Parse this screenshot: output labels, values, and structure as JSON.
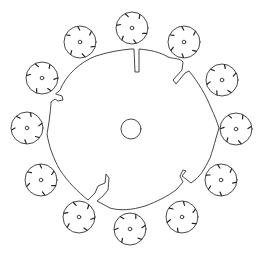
{
  "diagram": {
    "colors": {
      "line": "#333333",
      "background": "#ffffff"
    },
    "center_circle": {
      "cx": 131,
      "cy": 129,
      "r": 10
    },
    "outer_shape": {
      "cx": 131,
      "cy": 129,
      "r": 82,
      "notches": 6
    },
    "satellites": [
      {
        "cx": 132,
        "cy": 28,
        "r": 16
      },
      {
        "cx": 184,
        "cy": 42,
        "r": 16
      },
      {
        "cx": 222,
        "cy": 80,
        "r": 16
      },
      {
        "cx": 236,
        "cy": 129,
        "r": 16
      },
      {
        "cx": 221,
        "cy": 180,
        "r": 16
      },
      {
        "cx": 182,
        "cy": 217,
        "r": 16
      },
      {
        "cx": 130,
        "cy": 229,
        "r": 16
      },
      {
        "cx": 79,
        "cy": 217,
        "r": 16
      },
      {
        "cx": 41,
        "cy": 180,
        "r": 16
      },
      {
        "cx": 27,
        "cy": 128,
        "r": 16
      },
      {
        "cx": 42,
        "cy": 78,
        "r": 16
      },
      {
        "cx": 80,
        "cy": 42,
        "r": 16
      }
    ]
  }
}
